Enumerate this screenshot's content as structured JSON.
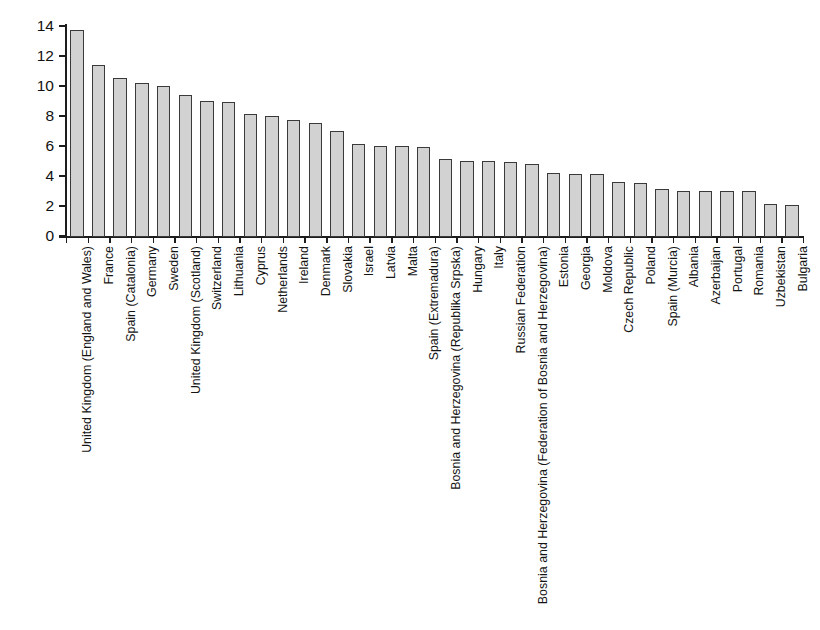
{
  "chart_data": {
    "type": "bar",
    "title": "",
    "subtitle": "",
    "xlabel": "",
    "ylabel": "Percentage",
    "ylim": [
      0,
      14
    ],
    "ytick_values": [
      0,
      2,
      4,
      6,
      8,
      10,
      12,
      14
    ],
    "ytick_labels": [
      "0",
      "2",
      "4",
      "6",
      "8",
      "10",
      "12",
      "14"
    ],
    "grid": false,
    "legend": null,
    "orientation": "vertical",
    "sorted": "descending",
    "categories": [
      "United Kingdom (England and Wales)",
      "France",
      "Spain (Catalonia)",
      "Germany",
      "Sweden",
      "United Kingdom (Scotland)",
      "Switzerland",
      "Lithuania",
      "Cyprus",
      "Netherlands",
      "Ireland",
      "Denmark",
      "Slovakia",
      "Israel",
      "Latvia",
      "Malta",
      "Spain (Extremadura)",
      "Bosnia and Herzegovina (Republika Srpska)",
      "Hungary",
      "Italy",
      "Russian Federation",
      "Bosnia and Herzegovina (Federation of Bosnia and Herzegovina)",
      "Estonia",
      "Georgia",
      "Moldova",
      "Czech Republic",
      "Poland",
      "Spain (Murcia)",
      "Albania",
      "Azerbaijan",
      "Portugal",
      "Romania",
      "Uzbekistan",
      "Bulgaria"
    ],
    "values": [
      13.8,
      11.5,
      10.6,
      10.3,
      10.1,
      9.5,
      9.1,
      9.0,
      8.2,
      8.1,
      7.8,
      7.6,
      7.1,
      6.2,
      6.1,
      6.1,
      6.0,
      5.2,
      5.1,
      5.1,
      5.0,
      4.9,
      4.3,
      4.2,
      4.2,
      3.7,
      3.6,
      3.2,
      3.1,
      3.1,
      3.1,
      3.1,
      2.2,
      2.15
    ]
  },
  "axis": {
    "y_title": "Percentage"
  }
}
